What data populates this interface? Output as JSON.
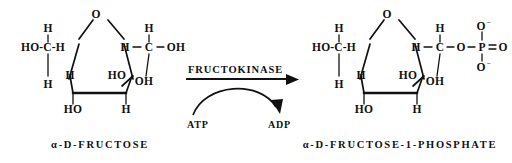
{
  "diagram": {
    "type": "chemical-reaction",
    "title_visible": false,
    "background_color": "#ffffff",
    "ink_color": "#111111"
  },
  "reaction": {
    "enzyme": "FRUCTOKINASE",
    "substrate_cofactor": "ATP",
    "product_cofactor": "ADP",
    "arrow_direction": "left-to-right"
  },
  "reactant": {
    "label": "α-D-FRUCTOSE",
    "ring_oxygen": "O",
    "atoms": {
      "c6_hydroxymethyl": "HO-C-H",
      "c6_top_h": "H",
      "c5_h": "H",
      "c4_h": "H",
      "c4_oh": "HO",
      "c3_h": "H",
      "c3_ho": "HO",
      "c2_oh": "OH",
      "c1_left_h": "H",
      "c1_carbon": "C",
      "c1_top_h": "H",
      "c1_oh": "OH"
    }
  },
  "product": {
    "label": "α-D-FRUCTOSE-1-PHOSPHATE",
    "ring_oxygen": "O",
    "atoms": {
      "c6_hydroxymethyl": "HO-C-H",
      "c6_top_h": "H",
      "c5_h": "H",
      "c4_h": "H",
      "c4_oh": "HO",
      "c3_h": "H",
      "c3_ho": "HO",
      "c2_oh": "OH",
      "c1_left_h": "H",
      "c1_carbon": "C",
      "c1_top_h": "H"
    },
    "phosphate": {
      "linker_o": "O",
      "phosphorus": "P",
      "double_bond_o": "O",
      "top_o": "O",
      "top_charge": "−",
      "bottom_o": "O",
      "bottom_charge": "−"
    }
  }
}
